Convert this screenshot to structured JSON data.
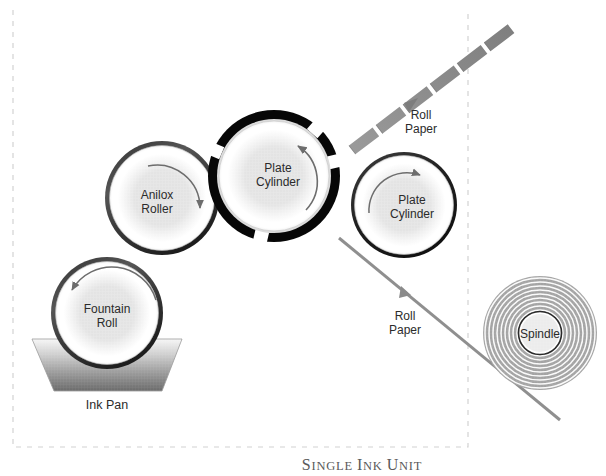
{
  "figure": {
    "caption": "Single Ink Unit",
    "background_color": "#ffffff",
    "frame": {
      "style": "dashed",
      "color": "#cfcfcf",
      "name": "dashed-boundary"
    }
  },
  "components": {
    "fountain_roll": {
      "label_line1": "Fountain",
      "label_line2": "Roll",
      "rotation": "counterclockwise",
      "cx": 107,
      "cy": 313,
      "r": 56,
      "ring_color": "#3c3c3c"
    },
    "anilox_roller": {
      "label_line1": "Anilox",
      "label_line2": "Roller",
      "rotation": "clockwise",
      "cx": 162,
      "cy": 198,
      "r": 57,
      "ring_color": "#3c3c3c"
    },
    "plate_cylinder_center": {
      "label_line1": "Plate",
      "label_line2": "Cylinder",
      "rotation": "clockwise",
      "cx": 274,
      "cy": 176,
      "r": 66,
      "ring_color": "#0a0a0a",
      "ring_note": "thick black ring with four white gaps"
    },
    "plate_cylinder_right": {
      "label_line1": "Plate",
      "label_line2": "Cylinder",
      "rotation": "clockwise",
      "cx": 404,
      "cy": 205,
      "r": 53,
      "ring_color": "#2a2a2a"
    },
    "spindle": {
      "label": "Spindle",
      "cx": 540,
      "cy": 333,
      "outer_r": 57,
      "core_r": 21,
      "ring_count": 10,
      "ring_color": "#8e8e8e"
    },
    "ink_pan": {
      "label": "Ink Pan",
      "fill_top": "#f2f2f2",
      "fill_bottom": "#6e6e6e"
    }
  },
  "flows": [
    {
      "label_line1": "Roll",
      "label_line2": "Paper",
      "name": "roll-paper-incoming",
      "style": "thick-dashed-band",
      "direction": "up-right",
      "color": "#8a8a8a"
    },
    {
      "label_line1": "Roll",
      "label_line2": "Paper",
      "name": "roll-paper-outgoing",
      "style": "thin-solid-line",
      "direction": "down-right",
      "color": "#8a8a8a"
    }
  ],
  "colors": {
    "text": "#2b2b2b",
    "caption": "#5a5a5a",
    "arrow": "#6d6d6d",
    "dash_frame": "#cfcfcf"
  }
}
